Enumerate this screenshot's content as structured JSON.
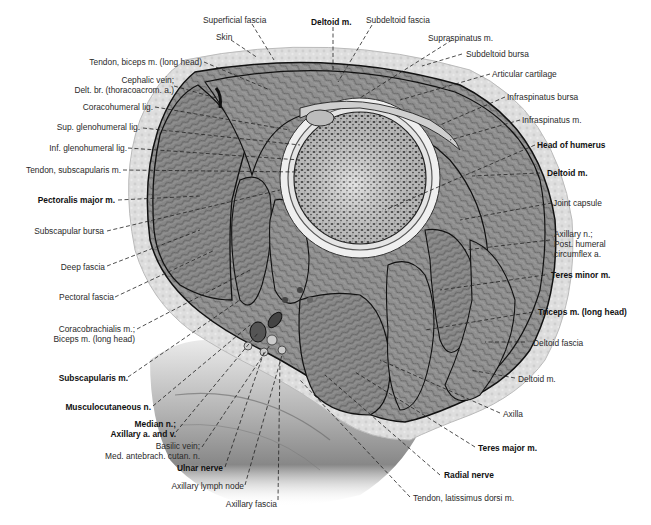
{
  "figure": {
    "caption_visible": false,
    "colors": {
      "background": "#ffffff",
      "skin": "#dcdcdc",
      "muscle": "#8e8e8e",
      "bone": "#c9c9c9",
      "outline": "#111111",
      "label_text": "#2a2a2a",
      "leader_line": "#222222"
    }
  },
  "labels": {
    "left": [
      {
        "id": "tendon-biceps",
        "text": "Tendon, biceps m. (long head)",
        "bold": false
      },
      {
        "id": "cephalic-vein",
        "lines": [
          "Cephalic vein;",
          "Delt. br. (thoracoacrom. a.)"
        ],
        "bold": false
      },
      {
        "id": "coracohumeral-lig",
        "text": "Coracohumeral lig.",
        "bold": false
      },
      {
        "id": "sup-glenohumeral-lig",
        "text": "Sup. glenohumeral lig.",
        "bold": false
      },
      {
        "id": "inf-glenohumeral-lig",
        "text": "Inf. glenohumeral lig.",
        "bold": false
      },
      {
        "id": "tendon-subscapularis",
        "text": "Tendon, subscapularis m.",
        "bold": false
      },
      {
        "id": "pectoralis-major",
        "text": "Pectoralis major m.",
        "bold": true
      },
      {
        "id": "subscapular-bursa",
        "text": "Subscapular bursa",
        "bold": false
      },
      {
        "id": "deep-fascia",
        "text": "Deep fascia",
        "bold": false
      },
      {
        "id": "pectoral-fascia",
        "text": "Pectoral fascia",
        "bold": false
      },
      {
        "id": "coracobrachialis",
        "lines": [
          "Coracobrachialis m.;",
          "Biceps m. (long head)"
        ],
        "bold": false
      },
      {
        "id": "subscapularis-m",
        "text": "Subscapularis m.",
        "bold": true
      },
      {
        "id": "musculocutaneous-n",
        "text": "Musculocutaneous n.",
        "bold": true
      },
      {
        "id": "median-n",
        "lines": [
          "Median n.;",
          "Axillary a. and v."
        ],
        "bold": true
      },
      {
        "id": "basilic-vein",
        "lines": [
          "Basilic vein;",
          "Med. antebrach. cutan. n."
        ],
        "bold": false
      },
      {
        "id": "ulnar-nerve",
        "text": "Ulnar nerve",
        "bold": true
      },
      {
        "id": "axillary-lymph-node",
        "text": "Axillary lymph node",
        "bold": false
      },
      {
        "id": "axillary-fascia",
        "text": "Axillary fascia",
        "bold": false
      }
    ],
    "top": [
      {
        "id": "superficial-fascia",
        "text": "Superficial fascia",
        "bold": false
      },
      {
        "id": "skin",
        "text": "Skin",
        "bold": false
      },
      {
        "id": "deltoid-top",
        "text": "Deltoid m.",
        "bold": true
      },
      {
        "id": "subdeltoid-fascia",
        "text": "Subdeltoid fascia",
        "bold": false
      }
    ],
    "right": [
      {
        "id": "supraspinatus",
        "text": "Supraspinatus m.",
        "bold": false
      },
      {
        "id": "subdeltoid-bursa",
        "text": "Subdeltoid bursa",
        "bold": false
      },
      {
        "id": "articular-cartilage",
        "text": "Articular cartilage",
        "bold": false
      },
      {
        "id": "infraspinatus-bursa",
        "text": "Infraspinatus bursa",
        "bold": false
      },
      {
        "id": "infraspinatus-m",
        "text": "Infraspinatus m.",
        "bold": false
      },
      {
        "id": "head-of-humerus",
        "text": "Head of humerus",
        "bold": true
      },
      {
        "id": "deltoid-right",
        "text": "Deltoid m.",
        "bold": true
      },
      {
        "id": "joint-capsule",
        "text": "Joint capsule",
        "bold": false
      },
      {
        "id": "axillary-n",
        "lines": [
          "Axillary n.;",
          "Post. humeral",
          "circumflex a."
        ],
        "bold": false
      },
      {
        "id": "teres-minor",
        "text": "Teres minor m.",
        "bold": true
      },
      {
        "id": "triceps-long-head",
        "text": "Triceps m. (long head)",
        "bold": true
      },
      {
        "id": "deltoid-fascia",
        "text": "Deltoid fascia",
        "bold": false
      },
      {
        "id": "deltoid-lower",
        "text": "Deltoid m.",
        "bold": false
      },
      {
        "id": "axilla",
        "text": "Axilla",
        "bold": false
      },
      {
        "id": "teres-major",
        "text": "Teres major m.",
        "bold": true
      },
      {
        "id": "radial-nerve",
        "text": "Radial nerve",
        "bold": true
      },
      {
        "id": "tendon-latissimus",
        "text": "Tendon, latissimus dorsi m.",
        "bold": false
      }
    ]
  },
  "left": {
    "tendon_biceps": "Tendon, biceps m. (long head)",
    "cephalic_1": "Cephalic vein;",
    "cephalic_2": "Delt. br. (thoracoacrom. a.)",
    "coracohumeral": "Coracohumeral lig.",
    "sup_gleno": "Sup. glenohumeral lig.",
    "inf_gleno": "Inf. glenohumeral lig.",
    "tendon_subscap": "Tendon, subscapularis m.",
    "pect_major": "Pectoralis major m.",
    "subscap_bursa": "Subscapular bursa",
    "deep_fascia": "Deep fascia",
    "pect_fascia": "Pectoral fascia",
    "coraco_1": "Coracobrachialis m.;",
    "coraco_2": "Biceps m. (long head)",
    "subscap_m": "Subscapularis m.",
    "musculocut": "Musculocutaneous n.",
    "median_1": "Median n.;",
    "median_2": "Axillary a. and v.",
    "basilic_1": "Basilic vein;",
    "basilic_2": "Med. antebrach. cutan. n.",
    "ulnar": "Ulnar nerve",
    "lymph": "Axillary lymph node",
    "ax_fascia": "Axillary fascia"
  },
  "top": {
    "sup_fascia": "Superficial fascia",
    "skin": "Skin",
    "deltoid": "Deltoid m.",
    "subdelt_fascia": "Subdeltoid fascia"
  },
  "right": {
    "supraspinatus": "Supraspinatus m.",
    "subdelt_bursa": "Subdeltoid bursa",
    "art_cartilage": "Articular cartilage",
    "infra_bursa": "Infraspinatus bursa",
    "infra_m": "Infraspinatus m.",
    "head_humerus": "Head of humerus",
    "deltoid": "Deltoid m.",
    "joint_capsule": "Joint capsule",
    "axillary_1": "Axillary n.;",
    "axillary_2": "Post. humeral",
    "axillary_3": "circumflex a.",
    "teres_minor": "Teres minor m.",
    "triceps": "Triceps m. (long head)",
    "delt_fascia": "Deltoid fascia",
    "deltoid_lower": "Deltoid m.",
    "axilla": "Axilla",
    "teres_major": "Teres major m.",
    "radial": "Radial nerve",
    "tendon_lat": "Tendon, latissimus dorsi m."
  }
}
